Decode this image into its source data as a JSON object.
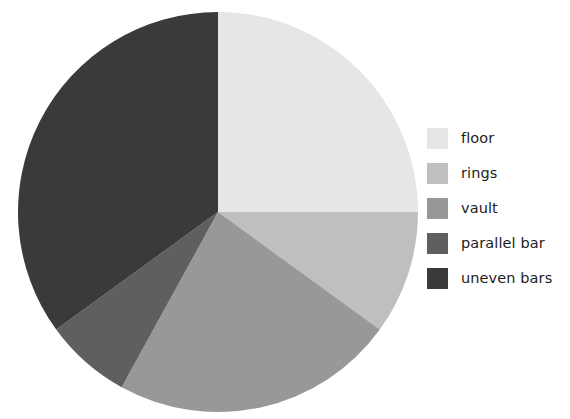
{
  "chart_data": {
    "type": "pie",
    "title": "",
    "subtitle": "",
    "xlabel": "",
    "ylabel": "",
    "grid": false,
    "legend_position": "right",
    "start_angle_deg": 90,
    "direction": "clockwise",
    "center": {
      "x": 218,
      "y": 212
    },
    "radius": 200,
    "categories": [
      "floor",
      "rings",
      "vault",
      "parallel bar",
      "uneven bars"
    ],
    "values": [
      25,
      10,
      23,
      7,
      35
    ],
    "value_unit": "percent",
    "colors": [
      "#e6e6e6",
      "#bfbfbf",
      "#989898",
      "#5f5f5f",
      "#3a3a3a"
    ],
    "slices": [
      {
        "label": "floor",
        "value": 25,
        "angle_deg": 90,
        "color": "#e6e6e6"
      },
      {
        "label": "rings",
        "value": 10,
        "angle_deg": 36,
        "color": "#bfbfbf"
      },
      {
        "label": "vault",
        "value": 23,
        "angle_deg": 82.8,
        "color": "#989898"
      },
      {
        "label": "parallel bar",
        "value": 7,
        "angle_deg": 25.2,
        "color": "#5f5f5f"
      },
      {
        "label": "uneven bars",
        "value": 35,
        "angle_deg": 126,
        "color": "#3a3a3a"
      }
    ]
  },
  "legend": {
    "items": [
      {
        "label": "floor",
        "color": "#e6e6e6"
      },
      {
        "label": "rings",
        "color": "#bfbfbf"
      },
      {
        "label": "vault",
        "color": "#989898"
      },
      {
        "label": "parallel bar",
        "color": "#5f5f5f"
      },
      {
        "label": "uneven bars",
        "color": "#3a3a3a"
      }
    ]
  }
}
